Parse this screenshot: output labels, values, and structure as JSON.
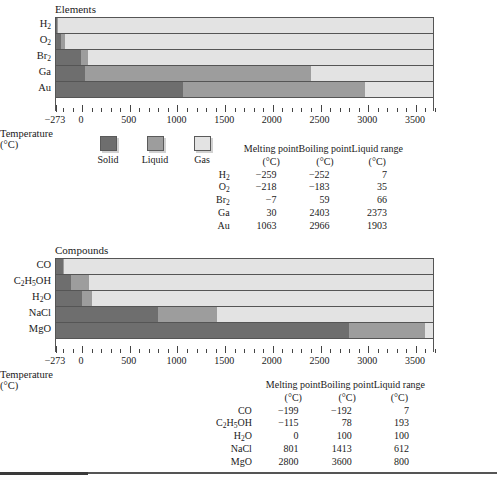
{
  "axis": {
    "title": "Temperature (°C)",
    "min": -273,
    "max": 3700,
    "tick_labels": [
      "−273",
      "0",
      "500",
      "1000",
      "1500",
      "2000",
      "2500",
      "3000",
      "3500"
    ],
    "tick_values": [
      -273,
      0,
      500,
      1000,
      1500,
      2000,
      2500,
      3000,
      3500
    ],
    "minor_tick_step": 100
  },
  "legend": {
    "items": [
      {
        "label": "Solid",
        "color": "#6e6e6e"
      },
      {
        "label": "Liquid",
        "color": "#9d9d9d"
      },
      {
        "label": "Gas",
        "color": "#e3e3e3"
      }
    ]
  },
  "table_headers": {
    "melting": "Melting point",
    "boiling": "Boiling point",
    "range": "Liquid range",
    "unit": "(°C)"
  },
  "elements": {
    "title": "Elements",
    "rows": [
      {
        "name": "H2",
        "label_html": "H<sub>2</sub>",
        "melting": -259,
        "boiling": -252,
        "range": 7,
        "melting_text": "−259",
        "boiling_text": "−252",
        "range_text": "7"
      },
      {
        "name": "O2",
        "label_html": "O<sub>2</sub>",
        "melting": -218,
        "boiling": -183,
        "range": 35,
        "melting_text": "−218",
        "boiling_text": "−183",
        "range_text": "35"
      },
      {
        "name": "Br2",
        "label_html": "Br<sub>2</sub>",
        "melting": -7,
        "boiling": 59,
        "range": 66,
        "melting_text": "−7",
        "boiling_text": "59",
        "range_text": "66"
      },
      {
        "name": "Ga",
        "label_html": "Ga",
        "melting": 30,
        "boiling": 2403,
        "range": 2373,
        "melting_text": "30",
        "boiling_text": "2403",
        "range_text": "2373"
      },
      {
        "name": "Au",
        "label_html": "Au",
        "melting": 1063,
        "boiling": 2966,
        "range": 1903,
        "melting_text": "1063",
        "boiling_text": "2966",
        "range_text": "1903"
      }
    ]
  },
  "compounds": {
    "title": "Compounds",
    "rows": [
      {
        "name": "CO",
        "label_html": "CO",
        "melting": -199,
        "boiling": -192,
        "range": 7,
        "melting_text": "−199",
        "boiling_text": "−192",
        "range_text": "7"
      },
      {
        "name": "C2H5OH",
        "label_html": "C<sub>2</sub>H<sub>5</sub>OH",
        "melting": -115,
        "boiling": 78,
        "range": 193,
        "melting_text": "−115",
        "boiling_text": "78",
        "range_text": "193"
      },
      {
        "name": "H2O",
        "label_html": "H<sub>2</sub>O",
        "melting": 0,
        "boiling": 100,
        "range": 100,
        "melting_text": "0",
        "boiling_text": "100",
        "range_text": "100"
      },
      {
        "name": "NaCl",
        "label_html": "NaCl",
        "melting": 801,
        "boiling": 1413,
        "range": 612,
        "melting_text": "801",
        "boiling_text": "1413",
        "range_text": "612"
      },
      {
        "name": "MgO",
        "label_html": "MgO",
        "melting": 2800,
        "boiling": 3600,
        "range": 800,
        "melting_text": "2800",
        "boiling_text": "3600",
        "range_text": "800"
      }
    ]
  },
  "chart_data": {
    "type": "bar",
    "subtype": "stacked-horizontal-phase-range",
    "xlabel": "Temperature (°C)",
    "ylabel": "",
    "xlim": [
      -273,
      3700
    ],
    "grid": false,
    "legend_position": "below-first-chart",
    "legend_entries": [
      "Solid",
      "Liquid",
      "Gas"
    ],
    "phase_colors": {
      "solid": "#6e6e6e",
      "liquid": "#9d9d9d",
      "gas": "#e3e3e3"
    },
    "charts": [
      {
        "title": "Elements",
        "categories": [
          "H2",
          "O2",
          "Br2",
          "Ga",
          "Au"
        ],
        "series": [
          {
            "name": "Solid",
            "note": "from -273 to melting point",
            "values": [
              -259,
              -218,
              -7,
              30,
              1063
            ]
          },
          {
            "name": "Liquid",
            "note": "melting point to boiling point",
            "values": [
              -252,
              -183,
              59,
              2403,
              2966
            ]
          },
          {
            "name": "Gas",
            "note": "boiling point to 3700",
            "values": [
              3700,
              3700,
              3700,
              3700,
              3700
            ]
          }
        ],
        "table": {
          "columns": [
            "Melting point (°C)",
            "Boiling point (°C)",
            "Liquid range (°C)"
          ],
          "rows": [
            {
              "label": "H2",
              "melting": -259,
              "boiling": -252,
              "liquid_range": 7
            },
            {
              "label": "O2",
              "melting": -218,
              "boiling": -183,
              "liquid_range": 35
            },
            {
              "label": "Br2",
              "melting": -7,
              "boiling": 59,
              "liquid_range": 66
            },
            {
              "label": "Ga",
              "melting": 30,
              "boiling": 2403,
              "liquid_range": 2373
            },
            {
              "label": "Au",
              "melting": 1063,
              "boiling": 2966,
              "liquid_range": 1903
            }
          ]
        }
      },
      {
        "title": "Compounds",
        "categories": [
          "CO",
          "C2H5OH",
          "H2O",
          "NaCl",
          "MgO"
        ],
        "series": [
          {
            "name": "Solid",
            "note": "from -273 to melting point",
            "values": [
              -199,
              -115,
              0,
              801,
              2800
            ]
          },
          {
            "name": "Liquid",
            "note": "melting point to boiling point",
            "values": [
              -192,
              78,
              100,
              1413,
              3600
            ]
          },
          {
            "name": "Gas",
            "note": "boiling point to 3700",
            "values": [
              3700,
              3700,
              3700,
              3700,
              3700
            ]
          }
        ],
        "table": {
          "columns": [
            "Melting point (°C)",
            "Boiling point (°C)",
            "Liquid range (°C)"
          ],
          "rows": [
            {
              "label": "CO",
              "melting": -199,
              "boiling": -192,
              "liquid_range": 7
            },
            {
              "label": "C2H5OH",
              "melting": -115,
              "boiling": 78,
              "liquid_range": 193
            },
            {
              "label": "H2O",
              "melting": 0,
              "boiling": 100,
              "liquid_range": 100
            },
            {
              "label": "NaCl",
              "melting": 801,
              "boiling": 1413,
              "liquid_range": 612
            },
            {
              "label": "MgO",
              "melting": 2800,
              "boiling": 3600,
              "liquid_range": 800
            }
          ]
        }
      }
    ]
  }
}
